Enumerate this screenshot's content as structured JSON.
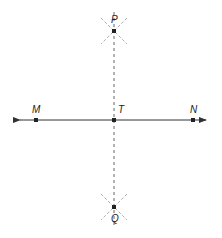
{
  "diagram": {
    "type": "perpendicular-bisector-construction",
    "colors": {
      "stroke": "#333333",
      "dashed": "#666666",
      "arc": "#999999"
    },
    "line": {
      "x1": 12,
      "x2": 214,
      "y": 120,
      "arrows": "both"
    },
    "points": [
      {
        "id": "M",
        "label": "M",
        "x": 36,
        "y": 120,
        "lx": 32,
        "ly": 113
      },
      {
        "id": "T",
        "label": "T",
        "x": 114,
        "y": 120,
        "lx": 118,
        "ly": 113
      },
      {
        "id": "N",
        "label": "N",
        "x": 193,
        "y": 120,
        "lx": 190,
        "ly": 113
      },
      {
        "id": "P",
        "label": "P",
        "x": 114,
        "y": 31,
        "lx": 111,
        "ly": 22
      },
      {
        "id": "Q",
        "label": "Q",
        "x": 114,
        "y": 207,
        "lx": 111,
        "ly": 222
      }
    ],
    "dashed_segment": {
      "x": 114,
      "y1": 12,
      "y2": 226
    }
  }
}
